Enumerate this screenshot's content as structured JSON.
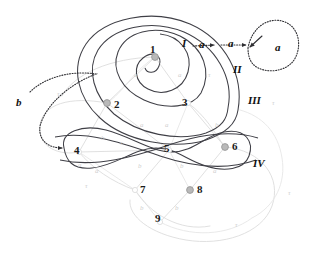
{
  "figure": {
    "background": "#ffffff",
    "width": 310,
    "height": 268
  },
  "colors": {
    "curve_dark": "#3f3f46",
    "graph_faint": "#dcdcdc",
    "graph_faint2": "#e6e6e6",
    "node_fill": "#b9b9b9",
    "node_stroke": "#9a9a9a",
    "label_dark": "#111111",
    "edge_label": "#cfcfcf",
    "dotted": "#2f2f33"
  },
  "nodes": [
    {
      "id": "1",
      "label": "1",
      "x": 155,
      "y": 57,
      "filled": true,
      "lx": 150,
      "ly": 44
    },
    {
      "id": "2",
      "label": "2",
      "x": 107,
      "y": 103,
      "filled": true,
      "lx": 114,
      "ly": 99
    },
    {
      "id": "3",
      "label": "3",
      "x": 188,
      "y": 103,
      "filled": false,
      "lx": 182,
      "ly": 97
    },
    {
      "id": "4",
      "label": "4",
      "x": 79,
      "y": 152,
      "filled": false,
      "lx": 74,
      "ly": 145
    },
    {
      "id": "5",
      "label": "5",
      "x": 169,
      "y": 150,
      "filled": false,
      "lx": 164,
      "ly": 143
    },
    {
      "id": "6",
      "label": "6",
      "x": 225,
      "y": 147,
      "filled": true,
      "lx": 232,
      "ly": 141
    },
    {
      "id": "7",
      "label": "7",
      "x": 135,
      "y": 190,
      "filled": false,
      "lx": 140,
      "ly": 184
    },
    {
      "id": "8",
      "label": "8",
      "x": 190,
      "y": 190,
      "filled": true,
      "lx": 197,
      "ly": 184
    },
    {
      "id": "9",
      "label": "9",
      "x": 160,
      "y": 222,
      "filled": false,
      "lx": 155,
      "ly": 213
    }
  ],
  "regions": [
    {
      "id": "I",
      "label": "I",
      "x": 182,
      "y": 38
    },
    {
      "id": "II",
      "label": "II",
      "x": 233,
      "y": 64
    },
    {
      "id": "III",
      "label": "III",
      "x": 248,
      "y": 95
    },
    {
      "id": "IV",
      "label": "IV",
      "x": 253,
      "y": 158
    }
  ],
  "arrow_labels": [
    {
      "id": "a1",
      "label": "a",
      "x": 199,
      "y": 39
    },
    {
      "id": "a2",
      "label": "a",
      "x": 228,
      "y": 38
    },
    {
      "id": "a3",
      "label": "a",
      "x": 275,
      "y": 42
    },
    {
      "id": "b1",
      "label": "b",
      "x": 16,
      "y": 97
    }
  ],
  "edge_labels": [
    {
      "id": "e1",
      "label": "a",
      "x": 134,
      "y": 72
    },
    {
      "id": "e2",
      "label": "a",
      "x": 178,
      "y": 72
    },
    {
      "id": "e3",
      "label": "τ",
      "x": 208,
      "y": 72
    },
    {
      "id": "e4",
      "label": "τ",
      "x": 57,
      "y": 91
    },
    {
      "id": "e5",
      "label": "a",
      "x": 140,
      "y": 122
    },
    {
      "id": "e6",
      "label": "a",
      "x": 165,
      "y": 122
    },
    {
      "id": "e7",
      "label": "b",
      "x": 215,
      "y": 122
    },
    {
      "id": "e8",
      "label": "b",
      "x": 101,
      "y": 135
    },
    {
      "id": "e9",
      "label": "τ",
      "x": 120,
      "y": 140
    },
    {
      "id": "e10",
      "label": "a",
      "x": 78,
      "y": 162
    },
    {
      "id": "e11",
      "label": "a",
      "x": 95,
      "y": 168
    },
    {
      "id": "e12",
      "label": "τ",
      "x": 85,
      "y": 183
    },
    {
      "id": "e13",
      "label": "b",
      "x": 138,
      "y": 163
    },
    {
      "id": "e14",
      "label": "b",
      "x": 180,
      "y": 163
    },
    {
      "id": "e15",
      "label": "a",
      "x": 213,
      "y": 168
    },
    {
      "id": "e16",
      "label": "b",
      "x": 140,
      "y": 205
    },
    {
      "id": "e17",
      "label": "b",
      "x": 175,
      "y": 205
    },
    {
      "id": "e18",
      "label": "τ",
      "x": 235,
      "y": 222
    },
    {
      "id": "e19",
      "label": "τ",
      "x": 288,
      "y": 190
    },
    {
      "id": "e20",
      "label": "τ",
      "x": 272,
      "y": 100
    }
  ],
  "curves": {
    "outer_III": "M 238 110 C 244 76 226 40 190 24 C 152 8 104 18 86 44 C 70 68 78 98 100 118 C 126 142 174 150 206 140 C 226 133 236 124 238 110 Z",
    "curve_II": "M 228 108 C 234 78 216 46 184 32 C 150 18 112 28 98 50 C 86 70 94 96 114 114 C 138 134 178 142 206 133 C 222 127 227 119 228 108 Z",
    "curve_I": "M 201 93 C 212 72 204 48 180 36 C 154 24 126 32 118 52 C 111 70 122 90 144 100 C 166 110 192 108 201 93 Z",
    "inner_1": "M 160 34 C 181 36 193 54 188 72 C 183 90 163 97 148 89 C 134 82 133 66 143 58 C 153 50 163 56 159 66 C 156 74 147 74 145 68",
    "lobe_IV": "M 64 148 C 60 132 82 124 106 130 C 132 137 152 152 172 152 C 194 152 204 136 224 132 C 246 128 254 142 249 156 C 244 170 224 172 206 166 C 186 160 176 148 156 148 C 134 148 116 166 92 168 C 72 170 66 160 64 148 Z",
    "crossA": "M 55 137 C 90 130 130 146 160 156 C 196 168 228 170 256 160",
    "crossB": "M 60 160 C 96 168 136 156 166 146 C 200 134 232 130 258 138",
    "graph": [
      "M 155 57 L 107 103",
      "M 155 57 L 188 103",
      "M 155 57 C 130 74 124 92 107 103",
      "M 107 103 L 79 152",
      "M 107 103 L 169 150",
      "M 188 103 L 169 150",
      "M 188 103 L 225 147",
      "M 188 103 C 206 116 214 132 225 147",
      "M 79 152 L 135 190",
      "M 79 152 C 92 168 112 182 135 190",
      "M 169 150 L 135 190",
      "M 169 150 L 190 190",
      "M 169 150 L 79 152",
      "M 225 147 L 190 190",
      "M 135 190 L 160 222",
      "M 190 190 L 160 222",
      "M 135 190 C 150 214 180 232 210 226",
      "M 160 222 C 190 238 228 236 252 218",
      "M 107 103 C 70 96 42 104 40 126 C 38 148 60 156 79 152",
      "M 225 147 C 262 150 282 178 272 206 C 262 234 222 246 186 240 C 150 234 128 216 130 200",
      "M 252 218 C 276 206 286 182 282 158 C 278 132 262 116 240 110",
      "M 155 57 C 110 58 74 74 62 96"
    ]
  },
  "dotted_paths": {
    "a_arrow_1": "M 193 46 L 214 45",
    "a_arrow_2": "M 221 45 L 246 45",
    "b_arrow": "M 30 92 C 44 78 70 70 96 74 C 70 84 46 104 40 126 C 38 140 48 148 62 148",
    "a_loop": "M 248 48 C 252 26 270 16 285 22 C 300 28 302 48 294 60 C 286 72 266 74 255 66 C 250 62 248 56 248 48"
  }
}
